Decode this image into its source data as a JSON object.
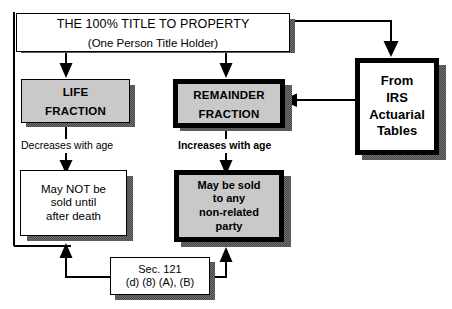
{
  "diagram": {
    "type": "flowchart",
    "title_box": {
      "line1": "THE 100% TITLE TO PROPERTY",
      "line2": "(One Person Title Holder)"
    },
    "life_fraction": {
      "line1": "LIFE",
      "line2": "FRACTION"
    },
    "remainder_fraction": {
      "line1": "REMAINDER",
      "line2": "FRACTION"
    },
    "irs_source": {
      "line1": "From",
      "line2": "IRS",
      "line3": "Actuarial",
      "line4": "Tables"
    },
    "life_caption": "Decreases with age",
    "remainder_caption": "Increases with age",
    "life_outcome": {
      "line1": "May NOT be",
      "line2": "sold until",
      "line3": "after death"
    },
    "remainder_outcome": {
      "line1": "May be sold",
      "line2": "to any",
      "line3": "non-related",
      "line4": "party"
    },
    "statute_box": {
      "line1": "Sec. 121",
      "line2": "(d) (8) (A), (B)"
    },
    "colors": {
      "ink": "#000000",
      "paper": "#ffffff",
      "fill_grey": "#c9c9c9",
      "shadow_grey": "#5a5a5a"
    }
  }
}
